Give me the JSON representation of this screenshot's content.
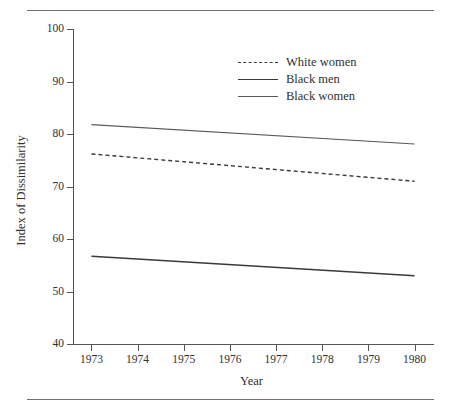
{
  "figure": {
    "has_top_rule": true,
    "has_bottom_rule": true,
    "background": "#ffffff",
    "ink": "#303030"
  },
  "axes": {
    "x_title": "Year",
    "y_title": "Index of Dissimilarity",
    "x_ticks": [
      "1973",
      "1974",
      "1975",
      "1976",
      "1977",
      "1978",
      "1979",
      "1980"
    ],
    "y_ticks": [
      "100",
      "90",
      "80",
      "70",
      "60",
      "50",
      "40"
    ]
  },
  "legend": {
    "position": "top-right-inside",
    "entries": [
      {
        "label": "White women",
        "style": "dashed"
      },
      {
        "label": "Black men",
        "style": "solid-thick"
      },
      {
        "label": "Black women",
        "style": "solid-thin"
      }
    ]
  },
  "chart_data": {
    "type": "line",
    "title": "",
    "subtitle": "",
    "xlabel": "Year",
    "ylabel": "Index of Dissimilarity",
    "x": [
      1973,
      1980
    ],
    "xlim": [
      1972.6,
      1980.4
    ],
    "ylim": [
      40,
      100
    ],
    "y_tick_values": [
      40,
      50,
      60,
      70,
      80,
      90,
      100
    ],
    "x_tick_values": [
      1973,
      1974,
      1975,
      1976,
      1977,
      1978,
      1979,
      1980
    ],
    "grid": false,
    "legend_position": "upper right",
    "series": [
      {
        "name": "White women",
        "style": "dashed",
        "color": "#3a3a3a",
        "values": [
          76.2,
          71.0
        ]
      },
      {
        "name": "Black men",
        "style": "solid",
        "color": "#3a3a3a",
        "values": [
          56.7,
          53.0
        ]
      },
      {
        "name": "Black women",
        "style": "solid",
        "color": "#5a5a5a",
        "values": [
          81.8,
          78.1
        ]
      }
    ]
  }
}
